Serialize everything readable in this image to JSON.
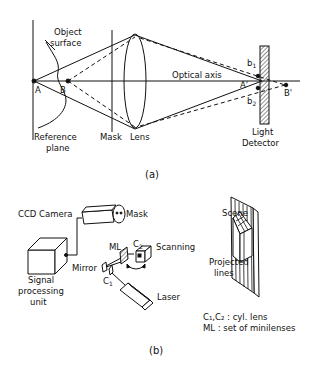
{
  "figure_a": {
    "caption": "(a)",
    "labels": {
      "object_surface_1": "Object",
      "object_surface_2": "surface",
      "point_a": "A",
      "point_b": "B",
      "reference_plane_1": "Reference",
      "reference_plane_2": "plane",
      "mask": "Mask",
      "lens": "Lens",
      "optical_axis": "Optical axis",
      "point_a_prime": "A'",
      "point_b_prime": "B'",
      "b1": "b",
      "b1_sub": "1",
      "b2": "b",
      "b2_sub": "2",
      "light_detector_1": "Light",
      "light_detector_2": "Detector"
    }
  },
  "figure_b": {
    "caption": "(b)",
    "labels": {
      "ccd_camera": "CCD Camera",
      "mask": "Mask",
      "signal_processing_1": "Signal",
      "signal_processing_2": "processing",
      "signal_processing_3": "unit",
      "ml": "ML",
      "c2": "C",
      "c2_sub": "2",
      "scanning": "Scanning",
      "mirror": "Mirror",
      "c1": "C",
      "c1_sub": "1",
      "laser": "Laser",
      "scene": "Scene",
      "projected_lines_1": "Projected",
      "projected_lines_2": "lines",
      "legend_1": "C₁,C₂ : cyl. lens",
      "legend_2": "ML : set of minilenses"
    }
  }
}
